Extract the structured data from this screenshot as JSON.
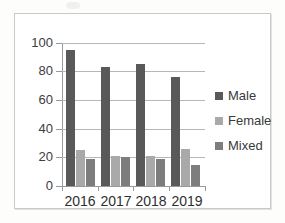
{
  "chart_data": {
    "type": "bar",
    "title": "",
    "subtitle": "",
    "xlabel": "",
    "ylabel": "",
    "categories": [
      "2016",
      "2017",
      "2018",
      "2019"
    ],
    "series": [
      {
        "name": "Male",
        "color": "#595959",
        "values": [
          95,
          83,
          85,
          76
        ]
      },
      {
        "name": "Female",
        "color": "#a9a9a9",
        "values": [
          25,
          21,
          21,
          26
        ]
      },
      {
        "name": "Mixed",
        "color": "#7d7d7d",
        "values": [
          19,
          20,
          19,
          15
        ]
      }
    ],
    "ylim": [
      0,
      100
    ],
    "ytick_labels": [
      "0",
      "20",
      "40",
      "60",
      "80",
      "100"
    ],
    "ytick_values": [
      0,
      20,
      40,
      60,
      80,
      100
    ],
    "grid": true,
    "grid_axis": "y",
    "legend_position": "right",
    "annotations": []
  },
  "legend": {
    "entries": [
      {
        "label": "Male",
        "swatch": "legend-swatch-male"
      },
      {
        "label": "Female",
        "swatch": "legend-swatch-female"
      },
      {
        "label": "Mixed",
        "swatch": "legend-swatch-mixed"
      }
    ]
  },
  "axes": {
    "y_labels": [
      "100",
      "80",
      "60",
      "40",
      "20",
      "0"
    ],
    "x_labels": [
      "2016",
      "2017",
      "2018",
      "2019"
    ]
  },
  "colors": {
    "male": "#595959",
    "female": "#a9a9a9",
    "mixed": "#7d7d7d",
    "gridline": "#b7b7b7",
    "axis": "#9a9a9a",
    "frame": "#c9c9c9",
    "text": "#3a3a3a",
    "background": "#ffffff"
  }
}
